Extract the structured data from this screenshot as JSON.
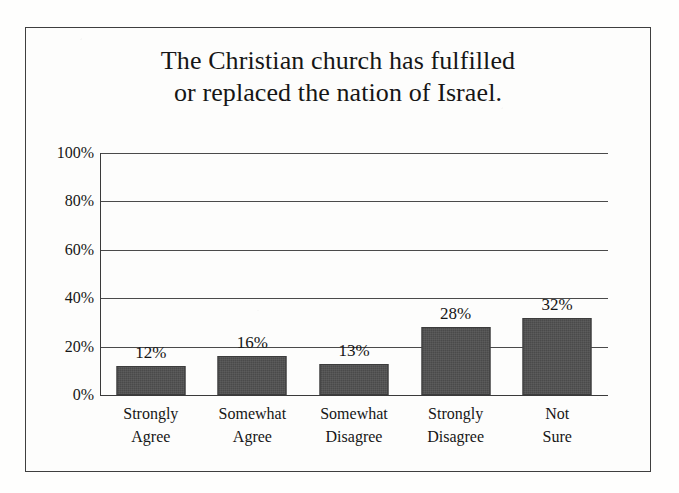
{
  "chart_data": {
    "type": "bar",
    "title": "The Christian church has fulfilled or replaced the nation of Israel.",
    "title_lines": [
      "The Christian church has fulfilled",
      "or replaced the nation of Israel."
    ],
    "categories": [
      "Strongly Agree",
      "Somewhat Agree",
      "Somewhat Disagree",
      "Strongly Disagree",
      "Not Sure"
    ],
    "category_lines": [
      [
        "Strongly",
        "Agree"
      ],
      [
        "Somewhat",
        "Agree"
      ],
      [
        "Somewhat",
        "Disagree"
      ],
      [
        "Strongly",
        "Disagree"
      ],
      [
        "Not",
        "Sure"
      ]
    ],
    "values": [
      12,
      16,
      13,
      28,
      32
    ],
    "value_labels": [
      "12%",
      "16%",
      "13%",
      "28%",
      "32%"
    ],
    "xlabel": "",
    "ylabel": "",
    "ylim": [
      0,
      100
    ],
    "ytick_values": [
      100,
      80,
      60,
      40,
      20,
      0
    ],
    "ytick_labels": [
      "100%",
      "80%",
      "60%",
      "40%",
      "20%",
      "0%"
    ],
    "grid": true,
    "legend": "none",
    "bar_color": "#4a4a4a",
    "axis_color": "#3a3a3a",
    "background_color": "#fdfdfc"
  }
}
